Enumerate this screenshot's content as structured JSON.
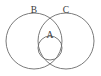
{
  "diagram": {
    "type": "venn-set-diagram",
    "background_color": "#ffffff",
    "stroke_color": "#6b6b6b",
    "label_color": "#3a3a3a",
    "sets": [
      {
        "label": "A",
        "role": "inner-subset",
        "shape": "circle",
        "cx": 50,
        "cy": 48,
        "r": 12,
        "label_x": 50,
        "label_y": 35.5
      },
      {
        "label": "B",
        "role": "left-set",
        "shape": "circle",
        "cx": 34,
        "cy": 41,
        "r": 28,
        "label_x": 34,
        "label_y": 11
      },
      {
        "label": "C",
        "role": "right-set",
        "shape": "circle",
        "cx": 66,
        "cy": 41,
        "r": 28,
        "label_x": 66,
        "label_y": 11
      }
    ]
  }
}
